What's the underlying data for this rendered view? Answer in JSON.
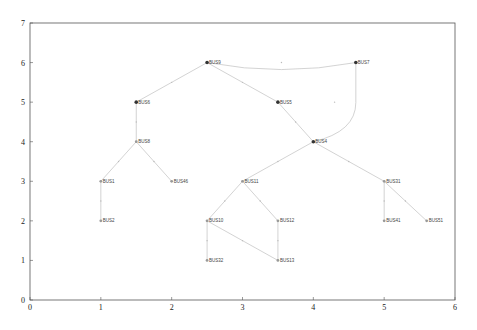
{
  "chart_data": {
    "type": "diagram",
    "title": "",
    "xlabel": "",
    "ylabel": "",
    "xlim": [
      0,
      6
    ],
    "ylim": [
      0,
      7
    ],
    "xticks": [
      "0",
      "1",
      "2",
      "3",
      "4",
      "5",
      "6"
    ],
    "yticks": [
      "0",
      "1",
      "2",
      "3",
      "4",
      "5",
      "6",
      "7"
    ],
    "grid": false,
    "nodes": [
      {
        "id": "BUS9",
        "x": 2.5,
        "y": 6.0,
        "filled": true
      },
      {
        "id": "BUS7",
        "x": 4.6,
        "y": 6.0,
        "filled": true
      },
      {
        "id": "BUS6",
        "x": 1.5,
        "y": 5.0,
        "filled": true
      },
      {
        "id": "BUS5",
        "x": 3.5,
        "y": 5.0,
        "filled": true
      },
      {
        "id": "BUS4",
        "x": 4.0,
        "y": 4.0,
        "filled": true
      },
      {
        "id": "BUS8",
        "x": 1.5,
        "y": 4.0,
        "filled": false
      },
      {
        "id": "BUS1",
        "x": 1.0,
        "y": 3.0,
        "filled": false
      },
      {
        "id": "BUS46",
        "x": 2.0,
        "y": 3.0,
        "filled": false
      },
      {
        "id": "BUS11",
        "x": 3.0,
        "y": 3.0,
        "filled": false
      },
      {
        "id": "BUS31",
        "x": 5.0,
        "y": 3.0,
        "filled": false
      },
      {
        "id": "BUS2",
        "x": 1.0,
        "y": 2.0,
        "filled": false
      },
      {
        "id": "BUS10",
        "x": 2.5,
        "y": 2.0,
        "filled": false
      },
      {
        "id": "BUS12",
        "x": 3.5,
        "y": 2.0,
        "filled": false
      },
      {
        "id": "BUS41",
        "x": 5.0,
        "y": 2.0,
        "filled": false
      },
      {
        "id": "BUS51",
        "x": 5.6,
        "y": 2.0,
        "filled": false
      },
      {
        "id": "BUS32",
        "x": 2.5,
        "y": 1.0,
        "filled": false
      },
      {
        "id": "BUS13",
        "x": 3.5,
        "y": 1.0,
        "filled": false
      }
    ],
    "edges": [
      [
        "BUS9",
        "BUS7"
      ],
      [
        "BUS9",
        "BUS6"
      ],
      [
        "BUS9",
        "BUS5"
      ],
      [
        "BUS7",
        "BUS4"
      ],
      [
        "BUS5",
        "BUS4"
      ],
      [
        "BUS6",
        "BUS8"
      ],
      [
        "BUS8",
        "BUS1"
      ],
      [
        "BUS8",
        "BUS46"
      ],
      [
        "BUS1",
        "BUS2"
      ],
      [
        "BUS4",
        "BUS11"
      ],
      [
        "BUS4",
        "BUS31"
      ],
      [
        "BUS11",
        "BUS10"
      ],
      [
        "BUS11",
        "BUS12"
      ],
      [
        "BUS10",
        "BUS32"
      ],
      [
        "BUS10",
        "BUS13"
      ],
      [
        "BUS12",
        "BUS13"
      ],
      [
        "BUS31",
        "BUS41"
      ],
      [
        "BUS31",
        "BUS51"
      ]
    ]
  },
  "colors": {
    "axis": "#555555",
    "edge": "#c8c8c8",
    "node_filled": "#333333",
    "node_open": "#999999"
  }
}
